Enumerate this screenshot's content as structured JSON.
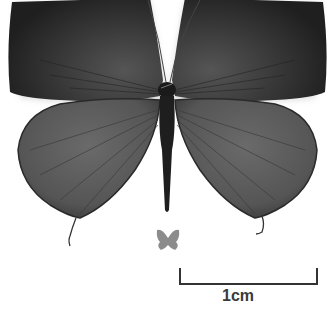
{
  "image": {
    "subject": "butterfly specimen, dorsal view",
    "palette": {
      "background": "#ffffff",
      "forewing": "#2c2c2c",
      "forewing_inner": "#4a4a4a",
      "hindwing": "#5a5a5a",
      "body": "#1e1e1e",
      "thumbnail": "#8c8c8c",
      "scale_bar": "#333333"
    }
  },
  "scale_bar": {
    "label": "1cm"
  }
}
